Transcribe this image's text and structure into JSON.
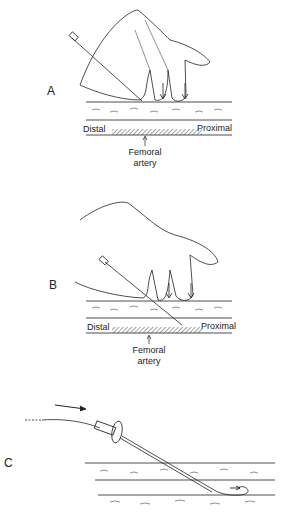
{
  "panels": [
    {
      "id": "A",
      "label": "A",
      "left_label": "Distal",
      "right_label": "Proximal",
      "vessel_label_line1": "Femoral",
      "vessel_label_line2": "artery"
    },
    {
      "id": "B",
      "label": "B",
      "left_label": "Distal",
      "right_label": "Proximal",
      "vessel_label_line1": "Femoral",
      "vessel_label_line2": "artery"
    },
    {
      "id": "C",
      "label": "C"
    }
  ],
  "colors": {
    "line": "#222222",
    "background": "#ffffff",
    "hatch": "#555555"
  }
}
